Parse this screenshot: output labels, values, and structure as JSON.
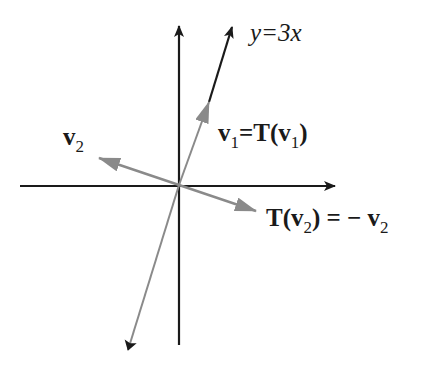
{
  "diagram": {
    "type": "linear-transformation-reflection",
    "line_label": "y=3x",
    "v2_label": {
      "main": "v",
      "sub": "2"
    },
    "v1_label": {
      "lhs_main": "v",
      "lhs_sub": "1",
      "eq": "=",
      "rhs_T": "T(",
      "rhs_main": "v",
      "rhs_sub": "1",
      "rhs_close": ")"
    },
    "tv2_label": {
      "T": "T(",
      "main": "v",
      "sub": "2",
      "close": ")",
      "eq": " = − ",
      "rhs_main": "v",
      "rhs_sub": "2"
    },
    "colors": {
      "axis": "#1a1a1a",
      "line_black": "#1a1a1a",
      "vector_gray": "#8a8a8a",
      "background": "#ffffff"
    },
    "geometry": {
      "origin": [
        179,
        185
      ],
      "x_axis": {
        "from": [
          20,
          186
        ],
        "to": [
          335,
          186
        ]
      },
      "y_axis": {
        "from": [
          179,
          345
        ],
        "to": [
          179,
          26
        ]
      },
      "line_upper_black": {
        "from": [
          209,
          102
        ],
        "to": [
          232,
          27
        ]
      },
      "v1_gray": {
        "from": [
          179,
          185
        ],
        "to": [
          209,
          102
        ]
      },
      "line_lower_gray": {
        "from": [
          179,
          185
        ],
        "to": [
          128,
          350
        ]
      },
      "v2_gray": {
        "from": [
          179,
          185
        ],
        "to": [
          99,
          158
        ]
      },
      "tv2_gray": {
        "from": [
          179,
          185
        ],
        "to": [
          256,
          211
        ]
      }
    }
  }
}
